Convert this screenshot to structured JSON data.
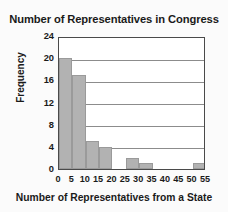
{
  "chart_data": {
    "type": "bar",
    "title": "Number of Representatives in Congress",
    "xlabel": "Number of Representatives from a State",
    "ylabel": "Frequency",
    "categories": [
      "0-5",
      "5-10",
      "10-15",
      "15-20",
      "20-25",
      "25-30",
      "30-35",
      "35-40",
      "40-45",
      "45-50",
      "50-55"
    ],
    "bin_starts": [
      0,
      5,
      10,
      15,
      20,
      25,
      30,
      35,
      40,
      45,
      50
    ],
    "bin_width": 5,
    "values": [
      20,
      17,
      5,
      4,
      0,
      2,
      1,
      0,
      0,
      0,
      1
    ],
    "xlim": [
      0,
      55
    ],
    "ylim": [
      0,
      24
    ],
    "xticks": [
      "0",
      "5",
      "10",
      "15",
      "20",
      "25",
      "30",
      "35",
      "40",
      "45",
      "50",
      "55"
    ],
    "xtick_values": [
      0,
      5,
      10,
      15,
      20,
      25,
      30,
      35,
      40,
      45,
      50,
      55
    ],
    "yticks": [
      "0",
      "4",
      "8",
      "12",
      "16",
      "20",
      "24"
    ],
    "ytick_values": [
      0,
      4,
      8,
      12,
      16,
      20,
      24
    ],
    "grid": "horizontal",
    "legend": "none",
    "colors": {
      "bar_fill": "#b2b2b2",
      "bar_border": "#9a9a9a",
      "plot_background": "#ffffff",
      "frame": "#4a4a4a",
      "gridline": "#8c8c8c",
      "text": "#1a1a1a",
      "page_background": "#fbfbfb"
    }
  }
}
